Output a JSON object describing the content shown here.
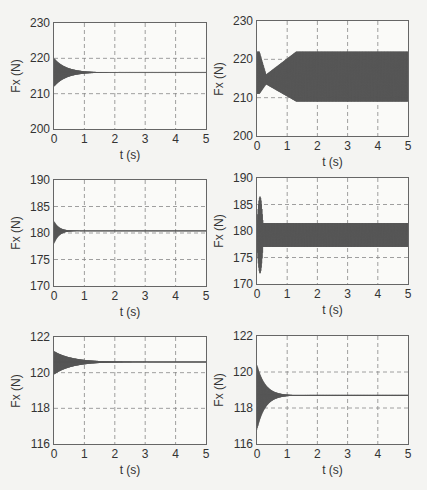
{
  "chart_data": [
    {
      "type": "line",
      "panel": "row1-left",
      "title": "",
      "xlabel": "t (s)",
      "ylabel": "Fx (N)",
      "xlim": [
        0,
        5
      ],
      "ylim": [
        200,
        230
      ],
      "xticks": [
        "0",
        "1",
        "2",
        "3",
        "4",
        "5"
      ],
      "yticks": [
        "200",
        "210",
        "220",
        "230"
      ],
      "grid": true,
      "description": "Damped oscillation decaying to steady value; trace ends ~2.1 s, steady line continues",
      "envelope": {
        "start_min": 212,
        "start_max": 220,
        "settle_time": 1.2,
        "steady_value": 216
      }
    },
    {
      "type": "line",
      "panel": "row1-right",
      "title": "",
      "xlabel": "t (s)",
      "ylabel": "Fx (N)",
      "xlim": [
        0,
        5
      ],
      "ylim": [
        200,
        230
      ],
      "xticks": [
        "0",
        "1",
        "2",
        "3",
        "4",
        "5"
      ],
      "yticks": [
        "200",
        "210",
        "220",
        "230"
      ],
      "grid": true,
      "description": "Sustained oscillation growing to a constant band",
      "envelope": {
        "initial_min": 211,
        "initial_max": 222,
        "neck_min": 213.5,
        "neck_max": 216,
        "band_min": 209,
        "band_max": 222,
        "band_reached_at": 1.3,
        "center": 215.5
      }
    },
    {
      "type": "line",
      "panel": "row2-left",
      "title": "",
      "xlabel": "t (s)",
      "ylabel": "Fx (N)",
      "xlim": [
        0,
        5
      ],
      "ylim": [
        170,
        190
      ],
      "xticks": [
        "0",
        "1",
        "2",
        "3",
        "4",
        "5"
      ],
      "yticks": [
        "170",
        "175",
        "180",
        "185",
        "190"
      ],
      "grid": true,
      "description": "Brief damped oscillation settling to steady value",
      "envelope": {
        "start_min": 178,
        "start_max": 182.2,
        "settle_time": 0.5,
        "steady_value": 180.4
      }
    },
    {
      "type": "line",
      "panel": "row2-right",
      "title": "",
      "xlabel": "t (s)",
      "ylabel": "Fx (N)",
      "xlim": [
        0,
        5
      ],
      "ylim": [
        170,
        190
      ],
      "xticks": [
        "0",
        "1",
        "2",
        "3",
        "4",
        "5"
      ],
      "yticks": [
        "170",
        "175",
        "180",
        "185",
        "190"
      ],
      "grid": true,
      "description": "Large initial transient then persistent oscillation band",
      "envelope": {
        "initial_min": 172,
        "initial_max": 186.5,
        "transient_end": 0.2,
        "band_min": 177,
        "band_max": 181.5,
        "center": 179.5
      }
    },
    {
      "type": "line",
      "panel": "row3-left",
      "title": "",
      "xlabel": "t (s)",
      "ylabel": "Fx (N)",
      "xlim": [
        0,
        5
      ],
      "ylim": [
        116,
        122
      ],
      "xticks": [
        "0",
        "1",
        "2",
        "3",
        "4",
        "5"
      ],
      "yticks": [
        "116",
        "118",
        "120",
        "122"
      ],
      "grid": true,
      "description": "Damped oscillation settling to steady value",
      "envelope": {
        "start_min": 119.9,
        "start_max": 121.2,
        "settle_time": 1.8,
        "steady_value": 120.6
      }
    },
    {
      "type": "line",
      "panel": "row3-right",
      "title": "",
      "xlabel": "t (s)",
      "ylabel": "Fx (N)",
      "xlim": [
        0,
        5
      ],
      "ylim": [
        116,
        122
      ],
      "xticks": [
        "0",
        "1",
        "2",
        "3",
        "4",
        "5"
      ],
      "yticks": [
        "116",
        "118",
        "120",
        "122"
      ],
      "grid": true,
      "description": "Damped oscillation settling to steady value",
      "envelope": {
        "start_min": 116.8,
        "start_max": 120.4,
        "settle_time": 0.8,
        "steady_value": 118.7
      }
    }
  ],
  "colors": {
    "trace": "#555555",
    "grid": "#888888",
    "frame": "#666666",
    "background": "#fafaf8"
  }
}
